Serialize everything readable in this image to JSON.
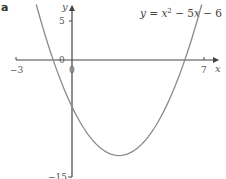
{
  "chart_data": {
    "type": "line",
    "panel_label": "a",
    "equation": {
      "lhs": "y",
      "rhs_parts": [
        "x",
        "2",
        " − 5",
        "x",
        " − 6"
      ]
    },
    "xlabel": "x",
    "ylabel": "y",
    "xlim": [
      -3,
      7.6
    ],
    "ylim": [
      -15,
      7.5
    ],
    "x_ticks": [
      {
        "value": -3,
        "label": "−3"
      },
      {
        "value": 0,
        "label": "0"
      },
      {
        "value": 7,
        "label": "7"
      }
    ],
    "y_ticks": [
      {
        "value": 5,
        "label": "5"
      },
      {
        "value": 0,
        "label": "0"
      },
      {
        "value": -15,
        "label": "−15"
      }
    ],
    "grid": false,
    "legend": null,
    "series": [
      {
        "name": "y = x² − 5x − 6",
        "function": "x^2 - 5x - 6",
        "x_range": [
          -1.9,
          6.9
        ],
        "roots": [
          -1,
          6
        ],
        "y_intercept": -6,
        "vertex": [
          2.5,
          -12.25
        ],
        "color": "#8a8a8a",
        "x": [
          -1.9,
          -1.5,
          -1,
          -0.5,
          0,
          0.5,
          1,
          1.5,
          2,
          2.5,
          3,
          3.5,
          4,
          4.5,
          5,
          5.5,
          6,
          6.5,
          6.9
        ],
        "y": [
          7.11,
          3.75,
          0,
          -3.25,
          -6,
          -8.25,
          -10,
          -11.25,
          -12,
          -12.25,
          -12,
          -11.25,
          -10,
          -8.25,
          -6,
          -3.25,
          0,
          3.75,
          7.11
        ]
      }
    ],
    "colors": {
      "curve": "#8a8a8a",
      "axis": "#444444",
      "text": "#555555"
    }
  }
}
